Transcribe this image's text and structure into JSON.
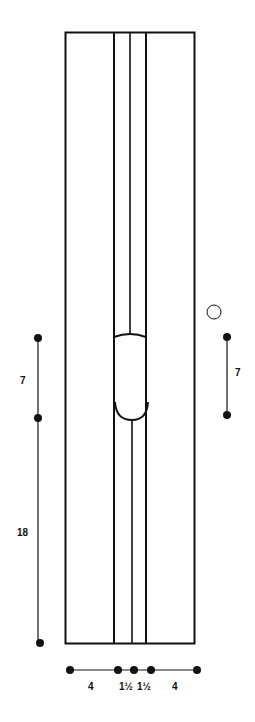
{
  "diagram": {
    "stroke_color": "#111111",
    "background": "#ffffff",
    "left_dimensions": [
      {
        "label": "7",
        "from_y": 338,
        "to_y": 418
      },
      {
        "label": "18",
        "from_y": 418,
        "to_y": 643
      }
    ],
    "right_dimension": {
      "label": "7",
      "from_y": 337,
      "to_y": 415
    },
    "right_marker": "open-circle",
    "bottom_dimensions": [
      {
        "label": "4"
      },
      {
        "label": "1½"
      },
      {
        "label": "1½"
      },
      {
        "label": "4"
      }
    ]
  }
}
